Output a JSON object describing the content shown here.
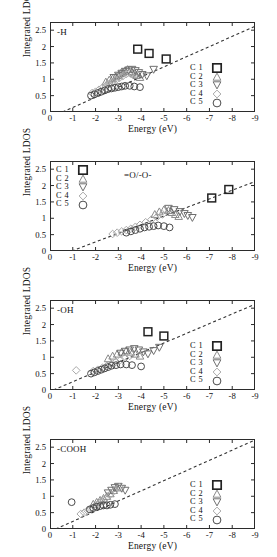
{
  "figure": {
    "axis": {
      "ylabel": "Integrated LDOS",
      "xlabel": "Energy (eV)",
      "yticks": [
        "0",
        "0.5",
        "1",
        "1.5",
        "2",
        "2.5"
      ],
      "xticks": [
        "0",
        "-1",
        "-2",
        "-3",
        "-4",
        "-5",
        "-6",
        "-7",
        "-8",
        "-9"
      ]
    },
    "legend_entries": [
      {
        "label": "C 1",
        "marker": "square-marker"
      },
      {
        "label": "C 2",
        "marker": "triangle-up-marker"
      },
      {
        "label": "C 3",
        "marker": "triangle-down-marker"
      },
      {
        "label": "C 4",
        "marker": "diamond-marker"
      },
      {
        "label": "C 5",
        "marker": "circle-marker"
      }
    ],
    "panels": [
      {
        "id": "panel-H",
        "label": "-H",
        "legend_position": "right"
      },
      {
        "id": "panel-O",
        "label": "=O/-O-",
        "legend_position": "left"
      },
      {
        "id": "panel-OH",
        "label": "-OH",
        "legend_position": "right"
      },
      {
        "id": "panel-COOH",
        "label": "-COOH",
        "legend_position": "right"
      }
    ]
  },
  "chart_data": [
    {
      "type": "scatter",
      "title": "-H",
      "xlabel": "Energy (eV)",
      "ylabel": "Integrated LDOS",
      "xlim": [
        0,
        -9
      ],
      "ylim": [
        0,
        2.75
      ],
      "grid": false,
      "legend_position": "right",
      "reference_line": {
        "style": "dashed",
        "x": [
          -0.55,
          -9.0
        ],
        "y": [
          0.0,
          2.62
        ]
      },
      "series": [
        {
          "name": "C 1",
          "marker": "square",
          "x": [
            -3.85,
            -4.35,
            -5.1
          ],
          "y": [
            1.92,
            1.79,
            1.62
          ]
        },
        {
          "name": "C 2",
          "marker": "triangle-up",
          "x": [
            -2.45,
            -2.6,
            -2.75,
            -2.9,
            -3.0,
            -3.1,
            -3.2,
            -3.3,
            -3.4,
            -3.5,
            -3.6,
            -3.7,
            -3.8,
            -3.95
          ],
          "y": [
            0.92,
            0.98,
            1.02,
            1.08,
            1.12,
            1.18,
            1.22,
            1.26,
            1.3,
            1.24,
            1.2,
            1.16,
            1.12,
            1.06
          ]
        },
        {
          "name": "C 3",
          "marker": "triangle-down",
          "x": [
            -2.8,
            -3.0,
            -3.15,
            -3.3,
            -3.45,
            -3.6,
            -3.75,
            -3.9,
            -4.05,
            -4.25,
            -4.55
          ],
          "y": [
            1.05,
            1.12,
            1.18,
            1.24,
            1.28,
            1.3,
            1.26,
            1.2,
            1.14,
            1.1,
            1.3
          ]
        },
        {
          "name": "C 4",
          "marker": "diamond",
          "x": [
            -1.85,
            -2.0,
            -2.15,
            -2.3,
            -2.45,
            -2.6,
            -2.75,
            -2.9,
            -3.05,
            -3.2,
            -3.35,
            -3.5
          ],
          "y": [
            0.58,
            0.62,
            0.68,
            0.74,
            0.8,
            0.86,
            0.92,
            0.98,
            1.04,
            1.1,
            1.16,
            1.2
          ]
        },
        {
          "name": "C 5",
          "marker": "circle",
          "x": [
            -1.8,
            -1.95,
            -2.1,
            -2.25,
            -2.4,
            -2.55,
            -2.7,
            -2.85,
            -3.0,
            -3.15,
            -3.3,
            -3.5,
            -3.7,
            -3.95
          ],
          "y": [
            0.5,
            0.54,
            0.58,
            0.62,
            0.66,
            0.7,
            0.72,
            0.74,
            0.76,
            0.78,
            0.8,
            0.8,
            0.78,
            0.76
          ]
        }
      ]
    },
    {
      "type": "scatter",
      "title": "=O/-O-",
      "xlabel": "Energy (eV)",
      "ylabel": "Integrated LDOS",
      "xlim": [
        0,
        -9
      ],
      "ylim": [
        0,
        2.75
      ],
      "grid": false,
      "legend_position": "left",
      "reference_line": {
        "style": "dashed",
        "x": [
          -0.95,
          -9.0
        ],
        "y": [
          0.0,
          2.12
        ]
      },
      "series": [
        {
          "name": "C 1",
          "marker": "square",
          "x": [
            -7.1,
            -7.85
          ],
          "y": [
            1.62,
            1.88
          ]
        },
        {
          "name": "C 2",
          "marker": "triangle-up",
          "x": [
            -4.6,
            -4.8,
            -5.0,
            -5.2,
            -5.35,
            -5.5,
            -5.65
          ],
          "y": [
            1.12,
            1.2,
            1.26,
            1.24,
            1.18,
            1.12,
            1.06
          ]
        },
        {
          "name": "C 3",
          "marker": "triangle-down",
          "x": [
            -5.2,
            -5.45,
            -5.7,
            -5.9,
            -6.05,
            -6.25
          ],
          "y": [
            1.3,
            1.26,
            1.2,
            1.14,
            1.08,
            1.02
          ]
        },
        {
          "name": "C 4",
          "marker": "diamond",
          "x": [
            -2.75,
            -2.95,
            -3.15,
            -3.35,
            -3.55,
            -3.75,
            -3.95,
            -4.2,
            -4.45,
            -4.7,
            -4.95
          ],
          "y": [
            0.52,
            0.56,
            0.6,
            0.64,
            0.68,
            0.74,
            0.8,
            0.88,
            0.96,
            1.04,
            1.12
          ]
        },
        {
          "name": "C 5",
          "marker": "circle",
          "x": [
            -3.35,
            -3.55,
            -3.75,
            -3.95,
            -4.15,
            -4.35,
            -4.55,
            -4.75,
            -5.0,
            -5.25
          ],
          "y": [
            0.56,
            0.6,
            0.64,
            0.68,
            0.72,
            0.74,
            0.76,
            0.78,
            0.76,
            0.72
          ]
        }
      ]
    },
    {
      "type": "scatter",
      "title": "-OH",
      "xlabel": "Energy (eV)",
      "ylabel": "Integrated LDOS",
      "xlim": [
        0,
        -9
      ],
      "ylim": [
        0,
        2.75
      ],
      "grid": false,
      "legend_position": "right",
      "reference_line": {
        "style": "dashed",
        "x": [
          -0.15,
          -9.0
        ],
        "y": [
          0.0,
          2.62
        ]
      },
      "series": [
        {
          "name": "C 1",
          "marker": "square",
          "x": [
            -4.3,
            -5.0
          ],
          "y": [
            1.78,
            1.65
          ]
        },
        {
          "name": "C 2",
          "marker": "triangle-up",
          "x": [
            -2.55,
            -2.75,
            -2.95,
            -3.15,
            -3.35,
            -3.55,
            -3.75,
            -3.95
          ],
          "y": [
            0.96,
            1.04,
            1.1,
            1.16,
            1.2,
            1.16,
            1.1,
            1.04
          ]
        },
        {
          "name": "C 3",
          "marker": "triangle-down",
          "x": [
            -3.1,
            -3.3,
            -3.5,
            -3.7,
            -3.9,
            -4.1,
            -4.3,
            -4.55,
            -4.8
          ],
          "y": [
            1.12,
            1.18,
            1.22,
            1.26,
            1.22,
            1.16,
            1.1,
            1.2,
            1.3
          ]
        },
        {
          "name": "C 4",
          "marker": "diamond",
          "x": [
            -1.15,
            -1.9,
            -2.1,
            -2.3,
            -2.5,
            -2.7,
            -2.9,
            -3.1,
            -3.3,
            -3.5
          ],
          "y": [
            0.6,
            0.58,
            0.62,
            0.68,
            0.74,
            0.8,
            0.86,
            0.92,
            0.98,
            1.04
          ]
        },
        {
          "name": "C 5",
          "marker": "circle",
          "x": [
            -1.8,
            -1.95,
            -2.1,
            -2.25,
            -2.4,
            -2.55,
            -2.7,
            -2.9,
            -3.1,
            -3.35,
            -3.6,
            -4.0
          ],
          "y": [
            0.5,
            0.54,
            0.58,
            0.62,
            0.66,
            0.7,
            0.74,
            0.76,
            0.78,
            0.78,
            0.76,
            0.72
          ]
        }
      ]
    },
    {
      "type": "scatter",
      "title": "-COOH",
      "xlabel": "Energy (eV)",
      "ylabel": "Integrated LDOS",
      "xlim": [
        0,
        -9
      ],
      "ylim": [
        0,
        2.75
      ],
      "grid": false,
      "legend_position": "right",
      "reference_line": {
        "style": "dashed",
        "x": [
          -0.25,
          -9.0
        ],
        "y": [
          0.0,
          2.72
        ]
      },
      "series": [
        {
          "name": "C 1",
          "marker": "square",
          "x": [],
          "y": []
        },
        {
          "name": "C 2",
          "marker": "triangle-up",
          "x": [
            -1.9,
            -2.05,
            -2.2,
            -2.35,
            -2.5,
            -2.65,
            -2.8,
            -2.95
          ],
          "y": [
            0.76,
            0.82,
            0.88,
            0.94,
            1.0,
            1.08,
            1.18,
            1.26
          ]
        },
        {
          "name": "C 3",
          "marker": "triangle-down",
          "x": [
            -2.55,
            -2.7,
            -2.85,
            -3.0,
            -3.15,
            -3.3
          ],
          "y": [
            1.1,
            1.18,
            1.26,
            1.3,
            1.24,
            1.18
          ]
        },
        {
          "name": "C 4",
          "marker": "diamond",
          "x": [
            -1.35,
            -1.5,
            -1.65,
            -1.8,
            -1.95,
            -2.1,
            -2.25,
            -2.45,
            -2.65,
            -2.85,
            -3.05
          ],
          "y": [
            0.46,
            0.5,
            0.56,
            0.62,
            0.68,
            0.76,
            0.84,
            0.94,
            1.06,
            1.18,
            1.28
          ]
        },
        {
          "name": "C 5",
          "marker": "circle",
          "x": [
            -0.95,
            -1.75,
            -1.9,
            -2.05,
            -2.2,
            -2.35,
            -2.5,
            -2.65,
            -2.85
          ],
          "y": [
            0.82,
            0.6,
            0.64,
            0.68,
            0.7,
            0.72,
            0.72,
            0.74,
            0.76
          ]
        }
      ]
    }
  ]
}
